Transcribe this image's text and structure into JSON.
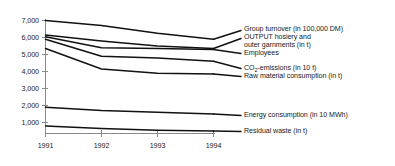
{
  "chart_data": {
    "type": "line",
    "title": "",
    "xlabel": "",
    "ylabel": "",
    "x": [
      "1991",
      "1992",
      "1993",
      "1994"
    ],
    "categories": [
      "1991",
      "1992",
      "1993",
      "1994"
    ],
    "ylim": [
      0,
      7000
    ],
    "yticks": [
      1000,
      2000,
      3000,
      4000,
      5000,
      6000,
      7000
    ],
    "ytick_labels": [
      "1,000",
      "2,000",
      "3,000",
      "4,000",
      "5,000",
      "6,000",
      "7,000"
    ],
    "xtick_labels": [
      "1991",
      "1992",
      "1993",
      "1994"
    ],
    "grid": false,
    "legend_position": "right",
    "line_color": "#111111",
    "axis_color": "#8a8a8a",
    "series": [
      {
        "name": "Group turnover (in 100,000 DM)",
        "values": [
          7000,
          6700,
          6250,
          5900
        ]
      },
      {
        "name": "OUTPUT hosiery and outer garnments (in t)",
        "values": [
          6150,
          5800,
          5500,
          5350
        ]
      },
      {
        "name": "Employees",
        "values": [
          6050,
          5400,
          5350,
          5300
        ]
      },
      {
        "name": "CO2-emissions (in 10 t)",
        "values": [
          5900,
          4900,
          4800,
          4600
        ]
      },
      {
        "name": "Raw material consumption (in t)",
        "values": [
          5350,
          4150,
          3900,
          3850
        ]
      },
      {
        "name": "Energy consumption (in 10 MWh)",
        "values": [
          1900,
          1700,
          1600,
          1500
        ]
      },
      {
        "name": "Residual waste (in t)",
        "values": [
          800,
          650,
          550,
          500
        ]
      }
    ]
  },
  "axis": {
    "y_labels": [
      "7,000",
      "6,000",
      "5,000",
      "4,000",
      "3,000",
      "2,000",
      "1,000"
    ],
    "x_labels": [
      "1991",
      "1992",
      "1993",
      "1994"
    ]
  },
  "legend": {
    "entries": [
      {
        "id": "group-turnover",
        "label": "Group turnover (in 100,000 DM)"
      },
      {
        "id": "output-hosiery-line1",
        "label": "OUTPUT hosiery and"
      },
      {
        "id": "output-hosiery-line2",
        "label": "outer garnments (in t)"
      },
      {
        "id": "employees",
        "label": "Employees"
      },
      {
        "id": "co2-emissions-pre",
        "label": "CO"
      },
      {
        "id": "co2-emissions-sub",
        "label": "2"
      },
      {
        "id": "co2-emissions-post",
        "label": "-emissions (in 10 t)"
      },
      {
        "id": "raw-material-consumption",
        "label": "Raw material consumption (in t)"
      },
      {
        "id": "energy-consumption",
        "label": "Energy consumption (in 10 MWh)"
      },
      {
        "id": "residual-waste",
        "label": "Residual waste (in t)"
      }
    ]
  }
}
